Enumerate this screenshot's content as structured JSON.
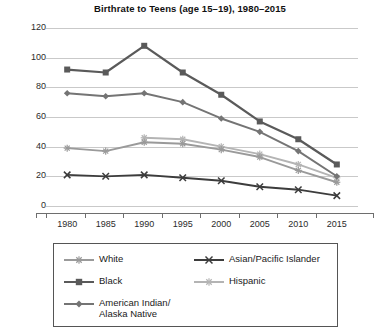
{
  "chart_data": {
    "type": "line",
    "title": "Birthrate to Teens (age 15–19), 1980–2015",
    "xlabel": "",
    "ylabel": "",
    "x": [
      1980,
      1985,
      1990,
      1995,
      2000,
      2005,
      2010,
      2015
    ],
    "xtick_labels": [
      "1980",
      "1985",
      "1990",
      "1995",
      "2000",
      "2005",
      "2010",
      "2015"
    ],
    "ytick_labels": [
      "0",
      "20",
      "40",
      "60",
      "80",
      "100",
      "120"
    ],
    "yticks": [
      0,
      20,
      40,
      60,
      80,
      100,
      120
    ],
    "ylim": [
      0,
      120
    ],
    "grid": true,
    "legend_position": "bottom",
    "series": [
      {
        "name": "White",
        "marker": "star",
        "color": "#9a9a9a",
        "values": [
          39,
          37,
          43,
          42,
          38,
          33,
          24,
          16
        ]
      },
      {
        "name": "Black",
        "marker": "square",
        "color": "#5a5a5a",
        "values": [
          92,
          90,
          108,
          90,
          75,
          57,
          45,
          28
        ]
      },
      {
        "name": "American Indian/\nAlaska Native",
        "marker": "diamond",
        "color": "#747474",
        "values": [
          76,
          74,
          76,
          70,
          59,
          50,
          37,
          20
        ]
      },
      {
        "name": "Asian/Pacific Islander",
        "marker": "x",
        "color": "#3c3c3c",
        "values": [
          21,
          20,
          21,
          19,
          17,
          13,
          11,
          7
        ]
      },
      {
        "name": "Hispanic",
        "marker": "plus",
        "color": "#b4b4b4",
        "values": [
          null,
          null,
          46,
          45,
          40,
          35,
          28,
          19
        ]
      }
    ],
    "legend_entries": [
      {
        "label": "White",
        "marker": "star",
        "color": "#9a9a9a",
        "column": "left",
        "row": 0
      },
      {
        "label": "Black",
        "marker": "square",
        "color": "#5a5a5a",
        "column": "left",
        "row": 1
      },
      {
        "label": "American Indian/\nAlaska Native",
        "marker": "diamond",
        "color": "#747474",
        "column": "left",
        "row": 2
      },
      {
        "label": "Asian/Pacific Islander",
        "marker": "x",
        "color": "#3c3c3c",
        "column": "right",
        "row": 0
      },
      {
        "label": "Hispanic",
        "marker": "plus",
        "color": "#b4b4b4",
        "column": "right",
        "row": 1
      }
    ]
  }
}
